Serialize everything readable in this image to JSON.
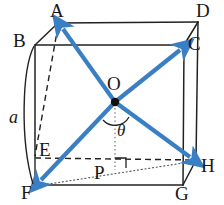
{
  "figure": {
    "type": "geometry-diagram",
    "width": 224,
    "height": 205,
    "background_color": "#ffffff",
    "line_color": "#222222",
    "arrow_color": "#3a7fc4",
    "dot_color": "#111111"
  },
  "labels": {
    "A": "A",
    "B": "B",
    "C": "C",
    "D": "D",
    "E": "E",
    "F": "F",
    "G": "G",
    "H": "H",
    "O": "O",
    "P": "P",
    "edge_length": "a",
    "angle": "θ"
  },
  "vertices": [
    {
      "name": "A",
      "x": 58,
      "y": 23,
      "label_x": 52,
      "label_y": 2
    },
    {
      "name": "B",
      "x": 35,
      "y": 45,
      "label_x": 14,
      "label_y": 32
    },
    {
      "name": "C",
      "x": 184,
      "y": 45,
      "label_x": 189,
      "label_y": 36
    },
    {
      "name": "D",
      "x": 198,
      "y": 22,
      "label_x": 198,
      "label_y": 2
    },
    {
      "name": "E",
      "x": 35,
      "y": 158,
      "label_x": 40,
      "label_y": 141
    },
    {
      "name": "F",
      "x": 35,
      "y": 185,
      "label_x": 22,
      "label_y": 184
    },
    {
      "name": "G",
      "x": 183,
      "y": 185,
      "label_x": 177,
      "label_y": 185
    },
    {
      "name": "H",
      "x": 196,
      "y": 160,
      "label_x": 200,
      "label_y": 157
    }
  ],
  "center": {
    "name": "O",
    "x": 115,
    "y": 102,
    "label_x": 108,
    "label_y": 76
  },
  "foot": {
    "name": "P",
    "x": 115,
    "y": 168,
    "label_x": 96,
    "label_y": 166
  },
  "arrows": [
    {
      "name": "diagonal-O-to-A",
      "from": "O",
      "to": "A"
    },
    {
      "name": "diagonal-O-to-C",
      "from": "O",
      "to": "C"
    },
    {
      "name": "diagonal-O-to-F",
      "from": "O",
      "to": "F"
    },
    {
      "name": "diagonal-O-to-H",
      "from": "O",
      "to": "H"
    }
  ],
  "annotations": {
    "angle_label": "θ",
    "angle_label_x": 119,
    "angle_label_y": 124,
    "edge_label": "a",
    "edge_label_x": 10,
    "edge_label_y": 110,
    "right_angle_at": "P"
  }
}
